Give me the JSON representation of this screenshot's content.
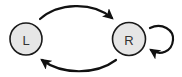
{
  "diagram": {
    "type": "state-transition",
    "nodes": [
      {
        "id": "L",
        "label": "L",
        "cx": 26,
        "cy": 39,
        "r": 16
      },
      {
        "id": "R",
        "label": "R",
        "cx": 129,
        "cy": 39,
        "r": 16.5
      }
    ],
    "edges": [
      {
        "from": "L",
        "to": "R",
        "route": "top-arc"
      },
      {
        "from": "R",
        "to": "L",
        "route": "bottom-arc"
      },
      {
        "from": "R",
        "to": "R",
        "route": "self-loop-right"
      }
    ],
    "colors": {
      "node_fill": "#e6e6e6",
      "node_stroke": "#1a1a1a",
      "label": "#333333",
      "edge": "#111111"
    }
  }
}
